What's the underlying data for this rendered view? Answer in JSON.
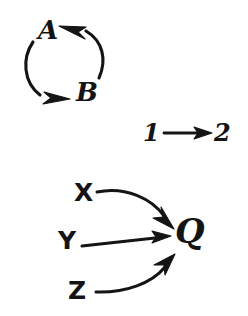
{
  "figure": {
    "background_color": "#ffffff",
    "ink_color": "#141414",
    "width": 248,
    "height": 316
  },
  "groups": [
    {
      "id": "cycle-ab",
      "name": "two-node-cycle",
      "nodes": [
        "A",
        "B"
      ],
      "edges": [
        {
          "from": "A",
          "to": "B",
          "style": "curved"
        },
        {
          "from": "B",
          "to": "A",
          "style": "curved"
        }
      ]
    },
    {
      "id": "edge-12",
      "name": "single-directed-edge",
      "nodes": [
        "1",
        "2"
      ],
      "edges": [
        {
          "from": "1",
          "to": "2",
          "style": "straight"
        }
      ]
    },
    {
      "id": "collider-q",
      "name": "three-parents-collider",
      "nodes": [
        "X",
        "Y",
        "Z",
        "Q"
      ],
      "edges": [
        {
          "from": "X",
          "to": "Q",
          "style": "curved"
        },
        {
          "from": "Y",
          "to": "Q",
          "style": "straight"
        },
        {
          "from": "Z",
          "to": "Q",
          "style": "curved"
        }
      ]
    }
  ],
  "labels": {
    "a": "A",
    "b": "B",
    "one": "1",
    "two": "2",
    "x": "X",
    "y": "Y",
    "z": "Z",
    "q": "Q"
  }
}
